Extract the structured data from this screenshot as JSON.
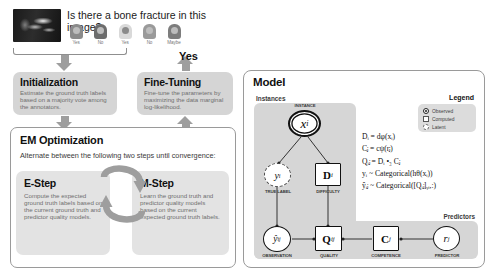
{
  "question_card": {
    "question": "Is there a bone fracture in this image?",
    "image_alt": "xray-thumbnail",
    "annotators": [
      {
        "id": "annotator-1",
        "answer": "Yes"
      },
      {
        "id": "annotator-2",
        "answer": "No"
      },
      {
        "id": "annotator-3",
        "answer": "Yes"
      },
      {
        "id": "annotator-4",
        "answer": "No"
      },
      {
        "id": "annotator-5",
        "answer": "Maybe"
      }
    ]
  },
  "flow": {
    "yes_label": "Yes"
  },
  "initialization": {
    "title": "Initialization",
    "body": "Estimate the ground truth labels based on a majority vote among the annotators."
  },
  "fine_tuning": {
    "title": "Fine-Tuning",
    "body": "Fine-tune the parameters by maximizing the data marginal log-likelihood."
  },
  "em": {
    "title": "EM Optimization",
    "subtitle": "Alternate between the following two steps until convergence:",
    "e_step": {
      "title": "E-Step",
      "body": "Compute the expected ground truth labels based on the current ground truth and predictor quality models."
    },
    "m_step": {
      "title": "M-Step",
      "body": "Learn the ground truth and predictor quality models based on the current expected ground truth labels."
    }
  },
  "model": {
    "title": "Model",
    "instances_label": "Instances",
    "predictors_label": "Predictors",
    "legend": {
      "title": "Legend",
      "items": [
        {
          "label": "Observed",
          "mark": "double-circle"
        },
        {
          "label": "Computed",
          "mark": "square"
        },
        {
          "label": "Latent",
          "mark": "dashed-circle"
        }
      ]
    },
    "nodes": [
      {
        "id": "node-x",
        "symbol": "x",
        "subscript": "i",
        "label": "INSTANCE",
        "kind": "observed"
      },
      {
        "id": "node-y",
        "symbol": "y",
        "subscript": "i",
        "label": "TRUE LABEL",
        "kind": "latent"
      },
      {
        "id": "node-d",
        "symbol": "D",
        "subscript": "i",
        "label": "DIFFICULTY",
        "kind": "computed"
      },
      {
        "id": "node-yhat",
        "symbol": "ŷ",
        "subscript": "ij",
        "label": "OBSERVATION",
        "kind": "observed"
      },
      {
        "id": "node-q",
        "symbol": "Q",
        "subscript": "ij",
        "label": "QUALITY",
        "kind": "computed"
      },
      {
        "id": "node-c",
        "symbol": "C",
        "subscript": "j",
        "label": "COMPETENCE",
        "kind": "computed"
      },
      {
        "id": "node-r",
        "symbol": "r",
        "subscript": "j",
        "label": "PREDICTOR",
        "kind": "observed"
      }
    ],
    "equations": [
      "Dᵢ = dφ(xᵢ)",
      "Cⱼ = cψ(rⱼ)",
      "Qᵢⱼ = Dᵢ •₃ Cⱼ",
      "yᵢ ~ Categorical(hθ(xᵢ))",
      "ŷᵢⱼ ~ Categorical([Qᵢⱼ]ᵧᵢ,:)"
    ]
  },
  "colors": {
    "panel_grey": "#d5d5d5",
    "plate_grey": "#d6d6d6",
    "arrow_grey": "#9e9e9e",
    "body_text": "#6f6f6f",
    "heading": "#111111"
  }
}
